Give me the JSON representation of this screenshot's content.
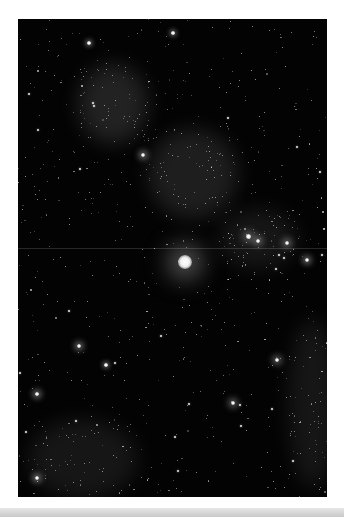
{
  "image": {
    "subject": "starfield",
    "description": "Black-and-white astrophotograph of a dense star field with diffuse nebulous clouds and one bright central star",
    "frame": {
      "left": 18,
      "top": 19,
      "width": 309,
      "height": 478
    },
    "background_color": "#030303",
    "page_color": "#ffffff",
    "footer_bar_color": "#d2d2d2"
  },
  "bright_stars": [
    {
      "name": "central-bright-star",
      "x": 167,
      "y": 243,
      "r": 7,
      "glow": 26
    },
    {
      "name": "cluster-star-a",
      "x": 230,
      "y": 217,
      "r": 2.5,
      "glow": 8
    },
    {
      "name": "cluster-star-b",
      "x": 240,
      "y": 222,
      "r": 2.2,
      "glow": 7
    },
    {
      "name": "right-star",
      "x": 269,
      "y": 224,
      "r": 2.2,
      "glow": 7
    },
    {
      "name": "right-star-2",
      "x": 289,
      "y": 241,
      "r": 2,
      "glow": 6
    },
    {
      "name": "left-mid-star",
      "x": 61,
      "y": 327,
      "r": 2,
      "glow": 6
    },
    {
      "name": "lower-right-star",
      "x": 259,
      "y": 341,
      "r": 2.2,
      "glow": 7
    },
    {
      "name": "lower-center-star",
      "x": 215,
      "y": 384,
      "r": 2.2,
      "glow": 7
    },
    {
      "name": "lower-left-star",
      "x": 19,
      "y": 375,
      "r": 1.8,
      "glow": 6
    },
    {
      "name": "bottom-left-star",
      "x": 19,
      "y": 459,
      "r": 2,
      "glow": 6
    },
    {
      "name": "upper-left-star",
      "x": 71,
      "y": 24,
      "r": 1.8,
      "glow": 5
    },
    {
      "name": "upper-center-star",
      "x": 155,
      "y": 14,
      "r": 1.8,
      "glow": 5
    },
    {
      "name": "nebula-star",
      "x": 125,
      "y": 136,
      "r": 2,
      "glow": 6
    },
    {
      "name": "mid-left-star",
      "x": 88,
      "y": 346,
      "r": 1.8,
      "glow": 5
    }
  ],
  "nebulae": [
    {
      "name": "upper-left-nebula",
      "x": 60,
      "y": 45,
      "w": 70,
      "h": 80,
      "opacity": 0.16
    },
    {
      "name": "center-nebula",
      "x": 130,
      "y": 110,
      "w": 90,
      "h": 90,
      "opacity": 0.14
    },
    {
      "name": "right-cluster-haze",
      "x": 200,
      "y": 190,
      "w": 80,
      "h": 60,
      "opacity": 0.1
    },
    {
      "name": "lower-left-haze",
      "x": 10,
      "y": 400,
      "w": 110,
      "h": 80,
      "opacity": 0.1
    },
    {
      "name": "right-edge-haze",
      "x": 270,
      "y": 300,
      "w": 50,
      "h": 170,
      "opacity": 0.1
    }
  ],
  "streak": {
    "y": 229
  },
  "star_field": {
    "count": 900,
    "seed": 7
  }
}
